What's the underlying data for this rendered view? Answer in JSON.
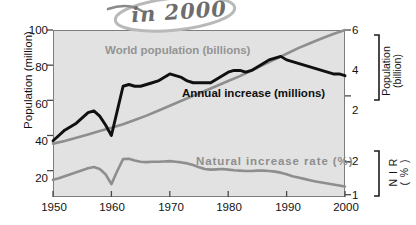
{
  "annotation": {
    "text": "in 2000"
  },
  "chart_data": {
    "type": "line",
    "title": "",
    "subtitle": "",
    "xlabel": "",
    "ylabel": "Population (million)",
    "xlim": [
      1950,
      2000
    ],
    "xticks": [
      "1950",
      "1960",
      "1970",
      "1980",
      "1990",
      "2000"
    ],
    "xtick_values": [
      1950,
      1960,
      1970,
      1980,
      1990,
      2000
    ],
    "grid": false,
    "legend_position": "inline-labels",
    "axes": {
      "left": {
        "label": "Population (million)",
        "ticks": [
          "20",
          "40",
          "60",
          "80",
          "100"
        ],
        "tick_values": [
          20,
          40,
          60,
          80,
          100
        ],
        "lim": [
          5,
          100
        ]
      },
      "right_upper": {
        "label_line1": "Population",
        "label_line2": "(billion)",
        "ticks": [
          "2",
          "4",
          "6"
        ],
        "tick_values": [
          2,
          4,
          6
        ],
        "lim": [
          0.93,
          6.0
        ]
      },
      "right_lower": {
        "label_line1": "N I R",
        "label_line2": "( % )",
        "ticks": [
          "1",
          "2"
        ],
        "tick_values": [
          1,
          2
        ],
        "lim": [
          0.93,
          6.0
        ]
      }
    },
    "series": [
      {
        "name": "World population (billions)",
        "color": "#8e8e8e",
        "axis": "right_upper",
        "unit": "billions",
        "x": [
          1950,
          1952,
          1954,
          1956,
          1958,
          1960,
          1962,
          1964,
          1966,
          1968,
          1970,
          1972,
          1974,
          1976,
          1978,
          1980,
          1982,
          1984,
          1986,
          1988,
          1990,
          1992,
          1994,
          1996,
          1998,
          2000
        ],
        "values": [
          2.55,
          2.63,
          2.73,
          2.83,
          2.93,
          3.03,
          3.14,
          3.27,
          3.4,
          3.55,
          3.7,
          3.85,
          4.0,
          4.15,
          4.3,
          4.45,
          4.6,
          4.77,
          4.94,
          5.11,
          5.28,
          5.45,
          5.6,
          5.74,
          5.88,
          6.0
        ]
      },
      {
        "name": "Annual increase (millions)",
        "color": "#101010",
        "axis": "left",
        "unit": "millions",
        "x": [
          1950,
          1951,
          1952,
          1953,
          1954,
          1955,
          1956,
          1957,
          1958,
          1959,
          1960,
          1961,
          1962,
          1963,
          1964,
          1965,
          1966,
          1967,
          1968,
          1969,
          1970,
          1971,
          1972,
          1973,
          1974,
          1975,
          1976,
          1977,
          1978,
          1979,
          1980,
          1981,
          1982,
          1983,
          1984,
          1985,
          1986,
          1987,
          1988,
          1989,
          1990,
          1991,
          1992,
          1993,
          1994,
          1995,
          1996,
          1997,
          1998,
          1999,
          2000
        ],
        "values": [
          37,
          40,
          43,
          45,
          47,
          50,
          53,
          54,
          51,
          46,
          40,
          54,
          68,
          69,
          68,
          68,
          69,
          70,
          71,
          73,
          75,
          74,
          73,
          71,
          70,
          70,
          70,
          70,
          72,
          74,
          76,
          77,
          77,
          76,
          77,
          79,
          81,
          83,
          84,
          85,
          83,
          82,
          81,
          80,
          79,
          78,
          77,
          76,
          75,
          75,
          74
        ]
      },
      {
        "name": "Natural increase rate (%)",
        "color": "#8e8e8e",
        "axis": "right_lower",
        "unit": "%",
        "x": [
          1950,
          1951,
          1952,
          1953,
          1954,
          1955,
          1956,
          1957,
          1958,
          1959,
          1960,
          1961,
          1962,
          1963,
          1964,
          1965,
          1966,
          1967,
          1968,
          1969,
          1970,
          1971,
          1972,
          1973,
          1974,
          1975,
          1976,
          1977,
          1978,
          1979,
          1980,
          1981,
          1982,
          1983,
          1984,
          1985,
          1986,
          1987,
          1988,
          1989,
          1990,
          1991,
          1992,
          1993,
          1994,
          1995,
          1996,
          1997,
          1998,
          1999,
          2000
        ],
        "values": [
          1.45,
          1.5,
          1.56,
          1.62,
          1.68,
          1.74,
          1.8,
          1.84,
          1.78,
          1.62,
          1.32,
          1.72,
          2.08,
          2.09,
          2.04,
          2.0,
          1.99,
          2.0,
          2.0,
          2.01,
          2.02,
          2.0,
          1.98,
          1.95,
          1.9,
          1.83,
          1.78,
          1.76,
          1.77,
          1.78,
          1.76,
          1.74,
          1.73,
          1.72,
          1.72,
          1.73,
          1.73,
          1.72,
          1.7,
          1.67,
          1.62,
          1.56,
          1.52,
          1.48,
          1.44,
          1.4,
          1.37,
          1.34,
          1.31,
          1.28,
          1.25
        ]
      }
    ]
  }
}
